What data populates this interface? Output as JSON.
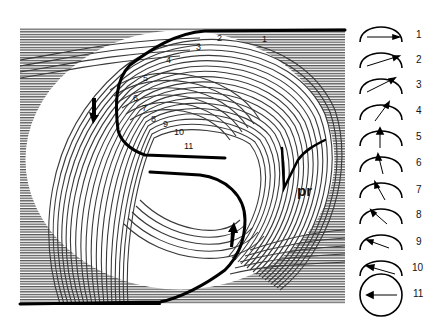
{
  "figure": {
    "main_panel": {
      "position_labels": [
        "1",
        "2",
        "3",
        "4",
        "5",
        "6",
        "7",
        "8",
        "9",
        "10",
        "11"
      ],
      "region_label": "pr",
      "arrows": [
        "down-arrow-left",
        "up-arrow-bottom-center"
      ]
    },
    "key": {
      "items": [
        {
          "label": "1",
          "angle_deg": 0
        },
        {
          "label": "2",
          "angle_deg": 18
        },
        {
          "label": "3",
          "angle_deg": 36
        },
        {
          "label": "4",
          "angle_deg": 54
        },
        {
          "label": "5",
          "angle_deg": 90
        },
        {
          "label": "6",
          "angle_deg": 100
        },
        {
          "label": "7",
          "angle_deg": 115
        },
        {
          "label": "8",
          "angle_deg": 135
        },
        {
          "label": "9",
          "angle_deg": 155
        },
        {
          "label": "10",
          "angle_deg": 165
        },
        {
          "label": "11",
          "angle_deg": 180
        }
      ]
    }
  }
}
